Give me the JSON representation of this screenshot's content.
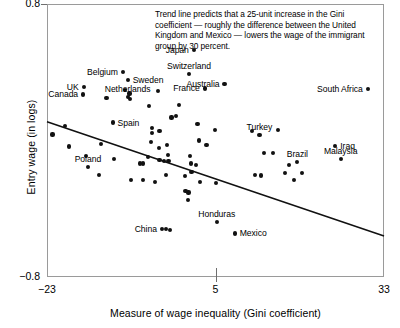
{
  "chart": {
    "type": "scatter",
    "title": "",
    "xlabel": "Measure of wage inequality (Gini coefficient)",
    "ylabel": "Entry wage (in logs)",
    "annotation": "Trend line predicts that a 25-unit increase in the Gini coefficient — roughly the difference between the United Kingdom and Mexico — lowers the wage of the immigrant group by 30 percent.",
    "xlim": [
      -23,
      33
    ],
    "ylim": [
      -0.8,
      0.8
    ],
    "xticks": [
      {
        "value": -23,
        "label": "−23"
      },
      {
        "value": 5,
        "label": "5"
      },
      {
        "value": 33,
        "label": "33"
      }
    ],
    "yticks": [
      {
        "value": 0.8,
        "label": "0.8"
      },
      {
        "value": -0.8,
        "label": "−0.8"
      }
    ],
    "grid": false,
    "legend": "none"
  },
  "chart_data": {
    "type": "scatter",
    "title": "",
    "xlabel": "Measure of wage inequality (Gini coefficient)",
    "ylabel": "Entry wage (in logs)",
    "xlim": [
      -23,
      33
    ],
    "ylim": [
      -0.8,
      0.8
    ],
    "annotations": [
      "Trend line predicts that a 25-unit increase in the Gini coefficient — roughly the difference between the United Kingdom and Mexico — lowers the wage of the immigrant group by 30 percent."
    ],
    "trend_line": {
      "x": [
        -23,
        33
      ],
      "y": [
        0.11,
        -0.56
      ],
      "slope": -0.012,
      "note": "25-unit Gini increase lowers immigrant entry wage by 30 percent"
    },
    "labeled_points": [
      {
        "label": "Japan",
        "x": 1.4,
        "y": 0.53,
        "label_pos": "left"
      },
      {
        "label": "Switzerland",
        "x": 0.6,
        "y": 0.39,
        "label_pos": "above"
      },
      {
        "label": "Belgium",
        "x": -10.4,
        "y": 0.4,
        "label_pos": "left"
      },
      {
        "label": "Sweden",
        "x": -9.6,
        "y": 0.355,
        "label_pos": "right"
      },
      {
        "label": "UK",
        "x": -16.9,
        "y": 0.315,
        "label_pos": "left"
      },
      {
        "label": "Canada",
        "x": -17.0,
        "y": 0.27,
        "label_pos": "left"
      },
      {
        "label": "Netherlands",
        "x": -9.6,
        "y": 0.255,
        "label_pos": "above"
      },
      {
        "label": "France",
        "x": 3.2,
        "y": 0.305,
        "label_pos": "left"
      },
      {
        "label": "Australia",
        "x": 6.5,
        "y": 0.33,
        "label_pos": "left"
      },
      {
        "label": "South Africa",
        "x": 30.3,
        "y": 0.3,
        "label_pos": "left"
      },
      {
        "label": "Spain",
        "x": -12.1,
        "y": 0.105,
        "label_pos": "right"
      },
      {
        "label": "Turkey",
        "x": 12.3,
        "y": 0.03,
        "label_pos": "above"
      },
      {
        "label": "Iraq",
        "x": 24.9,
        "y": -0.03,
        "label_pos": "right"
      },
      {
        "label": "Malaysia",
        "x": 25.8,
        "y": -0.11,
        "label_pos": "above"
      },
      {
        "label": "Brazil",
        "x": 18.6,
        "y": -0.125,
        "label_pos": "above"
      },
      {
        "label": "Poland",
        "x": -16.2,
        "y": -0.155,
        "label_pos": "above"
      },
      {
        "label": "China",
        "x": -3.9,
        "y": -0.52,
        "label_pos": "left"
      },
      {
        "label": "Honduras",
        "x": 5.2,
        "y": -0.48,
        "label_pos": "above"
      },
      {
        "label": "Mexico",
        "x": 8.2,
        "y": -0.545,
        "label_pos": "right"
      }
    ],
    "unlabeled_points": [
      {
        "x": -10.0,
        "y": 0.295
      },
      {
        "x": -9.3,
        "y": 0.275
      },
      {
        "x": -9.2,
        "y": 0.245
      },
      {
        "x": -13.1,
        "y": 0.25
      },
      {
        "x": -4.6,
        "y": 0.29
      },
      {
        "x": -6.0,
        "y": 0.2
      },
      {
        "x": -1.0,
        "y": 0.21
      },
      {
        "x": -2.3,
        "y": 0.135
      },
      {
        "x": -1.5,
        "y": 0.145
      },
      {
        "x": -22.1,
        "y": 0.035
      },
      {
        "x": -20.0,
        "y": 0.085
      },
      {
        "x": -19.3,
        "y": -0.035
      },
      {
        "x": -5.6,
        "y": 0.075
      },
      {
        "x": -5.5,
        "y": 0.045
      },
      {
        "x": -5.7,
        "y": -0.01
      },
      {
        "x": -14.0,
        "y": -0.02
      },
      {
        "x": -3.1,
        "y": -0.025
      },
      {
        "x": -2.9,
        "y": -0.085
      },
      {
        "x": 2.3,
        "y": 0.0
      },
      {
        "x": 3.5,
        "y": -0.025
      },
      {
        "x": 11.1,
        "y": 0.055
      },
      {
        "x": 15.4,
        "y": 0.06
      },
      {
        "x": -16.5,
        "y": -0.09
      },
      {
        "x": -11.8,
        "y": -0.11
      },
      {
        "x": -7.6,
        "y": -0.135
      },
      {
        "x": -7.1,
        "y": -0.135
      },
      {
        "x": -6.2,
        "y": -0.095
      },
      {
        "x": -4.3,
        "y": -0.115
      },
      {
        "x": -3.6,
        "y": -0.12
      },
      {
        "x": -2.8,
        "y": -0.12
      },
      {
        "x": 0.8,
        "y": -0.09
      },
      {
        "x": 0.9,
        "y": -0.135
      },
      {
        "x": 1.8,
        "y": -0.145
      },
      {
        "x": 1.0,
        "y": -0.185
      },
      {
        "x": 13.0,
        "y": -0.075
      },
      {
        "x": 14.6,
        "y": -0.075
      },
      {
        "x": 17.2,
        "y": -0.145
      },
      {
        "x": 16.5,
        "y": -0.19
      },
      {
        "x": 11.6,
        "y": -0.2
      },
      {
        "x": -14.3,
        "y": -0.2
      },
      {
        "x": -9.0,
        "y": -0.23
      },
      {
        "x": -7.0,
        "y": -0.23
      },
      {
        "x": -5.0,
        "y": -0.245
      },
      {
        "x": -3.2,
        "y": -0.2
      },
      {
        "x": 2.4,
        "y": -0.245
      },
      {
        "x": 5.1,
        "y": -0.25
      },
      {
        "x": -3.2,
        "y": -0.52
      },
      {
        "x": -2.6,
        "y": -0.525
      },
      {
        "x": 0.4,
        "y": -0.35
      },
      {
        "x": 0.5,
        "y": -0.305
      },
      {
        "x": 0.0,
        "y": -0.295
      },
      {
        "x": -0.1,
        "y": -0.21
      },
      {
        "x": -4.3,
        "y": 0.055
      },
      {
        "x": -4.4,
        "y": -0.045
      },
      {
        "x": 19.4,
        "y": -0.19
      },
      {
        "x": 18.0,
        "y": -0.23
      },
      {
        "x": 12.6,
        "y": -0.205
      },
      {
        "x": 2.0,
        "y": 0.095
      },
      {
        "x": 4.9,
        "y": 0.06
      }
    ]
  }
}
